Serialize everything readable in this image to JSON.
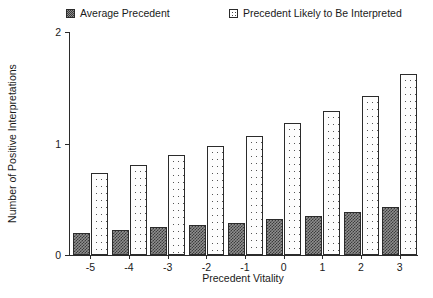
{
  "chart_data": {
    "type": "bar",
    "title": "",
    "xlabel": "Precedent Vitality",
    "ylabel": "Number of Positive Interpretations",
    "categories": [
      "-5",
      "-4",
      "-3",
      "-2",
      "-1",
      "0",
      "1",
      "2",
      "3"
    ],
    "ylim": [
      0,
      2
    ],
    "yticks": [
      "0",
      "1",
      "2"
    ],
    "grid": false,
    "legend_position": "top",
    "series": [
      {
        "name": "Average Precedent",
        "swatch": "dark-checkered-square-icon",
        "values": [
          0.2,
          0.22,
          0.25,
          0.27,
          0.29,
          0.32,
          0.35,
          0.39,
          0.43
        ]
      },
      {
        "name": "Precedent Likely to Be Interpreted",
        "swatch": "light-dotted-square-icon",
        "values": [
          0.74,
          0.81,
          0.9,
          0.98,
          1.07,
          1.18,
          1.29,
          1.43,
          1.62
        ]
      }
    ]
  },
  "legend": {
    "items": [
      {
        "label": "Average Precedent"
      },
      {
        "label": "Precedent Likely to Be Interpreted"
      }
    ]
  },
  "axes": {
    "y_title": "Number of Positive Interpretations",
    "x_title": "Precedent Vitality",
    "y_tick_labels": [
      "2",
      "1",
      "0"
    ],
    "x_tick_labels": [
      "-5",
      "-4",
      "-3",
      "-2",
      "-1",
      "0",
      "1",
      "2",
      "3"
    ]
  }
}
